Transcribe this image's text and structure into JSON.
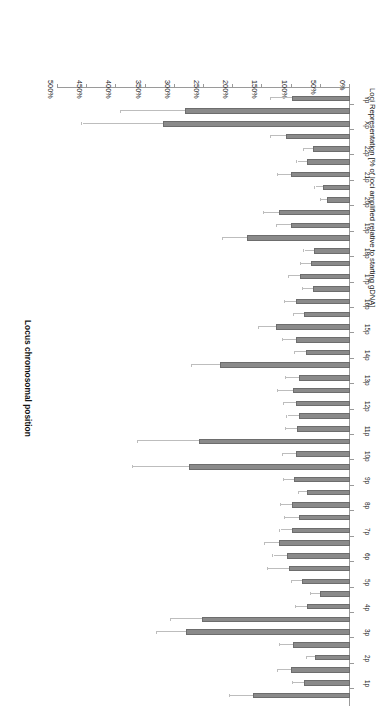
{
  "chart_data": {
    "type": "bar",
    "orientation": "horizontal",
    "title": "",
    "xlabel": "Locus chromosomal position",
    "ylabel": "Loci Representation [% of loci amplified relative to starting gDNA]",
    "ylim": [
      0,
      500
    ],
    "ytick_labels": [
      "0%",
      "50%",
      "100%",
      "150%",
      "200%",
      "250%",
      "300%",
      "350%",
      "400%",
      "450%",
      "500%"
    ],
    "ytick_values": [
      0,
      50,
      100,
      150,
      200,
      250,
      300,
      350,
      400,
      450,
      500
    ],
    "grid": false,
    "legend": false,
    "bar_color": "#8a8a8a",
    "error_color": "#bdbdbd",
    "categories": [
      "1p",
      "2p",
      "3p",
      "4p",
      "5p",
      "6p",
      "7p",
      "8p",
      "9p",
      "10p",
      "11p",
      "12p",
      "13p",
      "14p",
      "15p",
      "16p",
      "17p",
      "18p",
      "19p",
      "20p",
      "21p",
      "22p",
      "Xp",
      "Yp"
    ],
    "points": [
      {
        "label": "1p",
        "arm": "p",
        "value": 166,
        "err_high": 206
      },
      {
        "label": "1q",
        "arm": "q",
        "value": 79,
        "err_high": 97
      },
      {
        "label": "2p",
        "arm": "p",
        "value": 101,
        "err_high": 124
      },
      {
        "label": "2q",
        "arm": "q",
        "value": 60,
        "err_high": 74
      },
      {
        "label": "3p",
        "arm": "p",
        "value": 98,
        "err_high": 120
      },
      {
        "label": "3q",
        "arm": "q",
        "value": 281,
        "err_high": 331
      },
      {
        "label": "4p",
        "arm": "p",
        "value": 253,
        "err_high": 307
      },
      {
        "label": "4q",
        "arm": "q",
        "value": 74,
        "err_high": 92
      },
      {
        "label": "5p",
        "arm": "p",
        "value": 52,
        "err_high": 67
      },
      {
        "label": "5q",
        "arm": "q",
        "value": 82,
        "err_high": 100
      },
      {
        "label": "6p",
        "arm": "p",
        "value": 104,
        "err_high": 140
      },
      {
        "label": "6q",
        "arm": "q",
        "value": 108,
        "err_high": 131
      },
      {
        "label": "7p",
        "arm": "p",
        "value": 121,
        "err_high": 145
      },
      {
        "label": "7q",
        "arm": "q",
        "value": 100,
        "err_high": 119
      },
      {
        "label": "8p",
        "arm": "p",
        "value": 87,
        "err_high": 112
      },
      {
        "label": "8q",
        "arm": "q",
        "value": 100,
        "err_high": 118
      },
      {
        "label": "9p",
        "arm": "p",
        "value": 74,
        "err_high": 88
      },
      {
        "label": "9q",
        "arm": "q",
        "value": 95,
        "err_high": 113
      },
      {
        "label": "10p",
        "arm": "p",
        "value": 276,
        "err_high": 372
      },
      {
        "label": "10q",
        "arm": "q",
        "value": 93,
        "err_high": 115
      },
      {
        "label": "11p",
        "arm": "p",
        "value": 258,
        "err_high": 363
      },
      {
        "label": "11q",
        "arm": "q",
        "value": 90,
        "err_high": 110
      },
      {
        "label": "12p",
        "arm": "p",
        "value": 88,
        "err_high": 107
      },
      {
        "label": "12q",
        "arm": "q",
        "value": 92,
        "err_high": 113
      },
      {
        "label": "13p",
        "arm": "p",
        "value": 98,
        "err_high": 123
      },
      {
        "label": "13q",
        "arm": "q",
        "value": 88,
        "err_high": 110
      },
      {
        "label": "14p",
        "arm": "p",
        "value": 222,
        "err_high": 270
      },
      {
        "label": "14q",
        "arm": "q",
        "value": 76,
        "err_high": 94
      },
      {
        "label": "15p",
        "arm": "p",
        "value": 93,
        "err_high": 114
      },
      {
        "label": "15q",
        "arm": "q",
        "value": 127,
        "err_high": 155
      },
      {
        "label": "16p",
        "arm": "p",
        "value": 78,
        "err_high": 96
      },
      {
        "label": "16q",
        "arm": "q",
        "value": 92,
        "err_high": 112
      },
      {
        "label": "17p",
        "arm": "p",
        "value": 63,
        "err_high": 80
      },
      {
        "label": "17q",
        "arm": "q",
        "value": 85,
        "err_high": 104
      },
      {
        "label": "18p",
        "arm": "p",
        "value": 67,
        "err_high": 84
      },
      {
        "label": "18q",
        "arm": "q",
        "value": 62,
        "err_high": 78
      },
      {
        "label": "19p",
        "arm": "p",
        "value": 176,
        "err_high": 218
      },
      {
        "label": "19q",
        "arm": "q",
        "value": 101,
        "err_high": 125
      },
      {
        "label": "20p",
        "arm": "p",
        "value": 122,
        "err_high": 148
      },
      {
        "label": "20q",
        "arm": "q",
        "value": 39,
        "err_high": 49
      },
      {
        "label": "21p",
        "arm": "p",
        "value": 47,
        "err_high": 59
      },
      {
        "label": "21q",
        "arm": "q",
        "value": 101,
        "err_high": 123
      },
      {
        "label": "22p",
        "arm": "p",
        "value": 73,
        "err_high": 90
      },
      {
        "label": "22q",
        "arm": "q",
        "value": 64,
        "err_high": 79
      },
      {
        "label": "Xp",
        "arm": "p",
        "value": 109,
        "err_high": 135
      },
      {
        "label": "Xq",
        "arm": "q",
        "value": 320,
        "err_high": 458
      },
      {
        "label": "Yp",
        "arm": "p",
        "value": 283,
        "err_high": 392
      },
      {
        "label": "Yq",
        "arm": "q",
        "value": 100,
        "err_high": 136
      }
    ]
  }
}
